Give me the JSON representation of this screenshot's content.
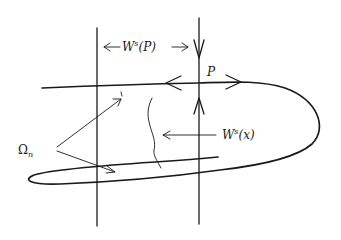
{
  "figure": {
    "type": "stable-unstable-manifold-diagram",
    "labels": {
      "ws_p": {
        "base": "W",
        "sup": "s",
        "arg": "(P)"
      },
      "ws_x": {
        "base": "W",
        "sup": "s",
        "arg": "(x)"
      },
      "point": "P",
      "omega": {
        "base": "Ω",
        "sub": "n"
      }
    },
    "elements": {
      "vertical_lines": 2,
      "unstable_manifold_curve": "folded loop through P",
      "stable_fiber_curve": "wavy curve labeled W^s(x)",
      "arrows_to_omega_regions": 2
    },
    "colors": {
      "ink": "#1a1a1a",
      "background": "#ffffff"
    }
  }
}
